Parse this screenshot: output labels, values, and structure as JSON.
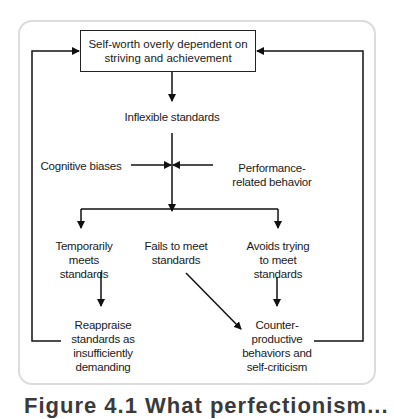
{
  "diagram": {
    "nodes": {
      "self_worth": "Self-worth overly dependent on striving and achievement",
      "inflexible": "Inflexible standards",
      "cognitive": "Cognitive biases",
      "performance": "Performance-related behavior",
      "temporarily": "Temporarily meets standards",
      "fails": "Fails to meet standards",
      "avoids": "Avoids trying to meet standards",
      "reappraise": "Reappraise standards as insufficiently demanding",
      "counter": "Counter-productive behaviors and self-criticism"
    },
    "edges": [
      {
        "from": "self_worth",
        "to": "inflexible"
      },
      {
        "from": "cognitive",
        "to": "inflexible_branch"
      },
      {
        "from": "performance",
        "to": "inflexible_branch"
      },
      {
        "from": "inflexible",
        "to": "temporarily"
      },
      {
        "from": "inflexible",
        "to": "fails"
      },
      {
        "from": "inflexible",
        "to": "avoids"
      },
      {
        "from": "temporarily",
        "to": "reappraise"
      },
      {
        "from": "fails",
        "to": "counter"
      },
      {
        "from": "avoids",
        "to": "counter"
      },
      {
        "from": "reappraise",
        "to": "self_worth"
      },
      {
        "from": "counter",
        "to": "self_worth"
      }
    ],
    "caption": "Figure 4.1 What perfectionism..."
  }
}
